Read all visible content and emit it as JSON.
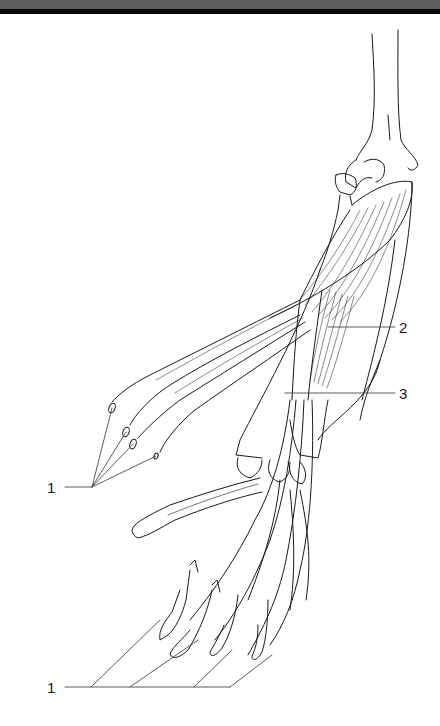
{
  "figure": {
    "line_color": "#1a1a1a",
    "label_line_color": "#333333"
  },
  "labels": [
    {
      "id": "label-1-top",
      "text": "1",
      "x": 47,
      "y": 480
    },
    {
      "id": "label-2",
      "text": "2",
      "x": 399,
      "y": 320
    },
    {
      "id": "label-3",
      "text": "3",
      "x": 399,
      "y": 386
    },
    {
      "id": "label-1-bottom",
      "text": "1",
      "x": 47,
      "y": 680
    }
  ]
}
